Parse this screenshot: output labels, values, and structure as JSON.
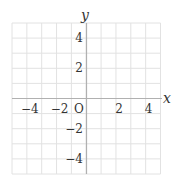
{
  "chart_data": {
    "type": "line",
    "title": "",
    "xlabel": "x",
    "ylabel": "y",
    "xlim": [
      -5,
      5
    ],
    "ylim": [
      -5,
      5
    ],
    "grid": true,
    "grid_step": 1,
    "origin_label": "O",
    "x_ticks": [
      {
        "value": -4,
        "label": "−4"
      },
      {
        "value": -2,
        "label": "−2"
      },
      {
        "value": 2,
        "label": "2"
      },
      {
        "value": 4,
        "label": "4"
      }
    ],
    "y_ticks": [
      {
        "value": 4,
        "label": "4"
      },
      {
        "value": 2,
        "label": "2"
      },
      {
        "value": -2,
        "label": "−2"
      },
      {
        "value": -4,
        "label": "−4"
      }
    ],
    "series": []
  },
  "colors": {
    "grid": "#e2e2e2",
    "axis": "#b0b0b0",
    "text": "#333333"
  }
}
